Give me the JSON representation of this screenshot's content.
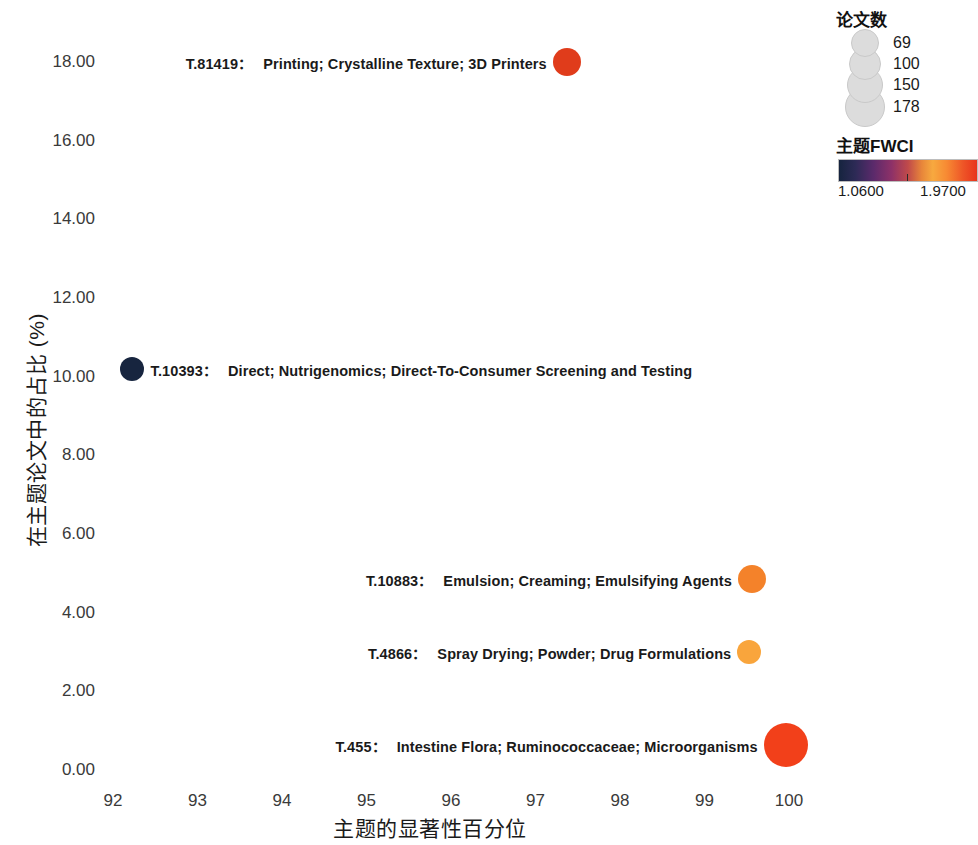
{
  "chart_data": {
    "type": "scatter",
    "title": "",
    "xlabel": "主题的显著性百分位",
    "ylabel": "在主题论文中的占比 (%)",
    "xlim": [
      91.6,
      100.4
    ],
    "ylim": [
      -0.45,
      18.6
    ],
    "xticks": [
      92,
      93,
      94,
      95,
      96,
      97,
      98,
      99,
      100
    ],
    "yticks": [
      "0.00",
      "2.00",
      "4.00",
      "6.00",
      "8.00",
      "10.00",
      "12.00",
      "14.00",
      "16.00",
      "18.00"
    ],
    "grid": false,
    "legend_position": "top-right",
    "points": [
      {
        "id": "T.81419",
        "terms": "Printing; Crystalline Texture; 3D Printers",
        "x": 97.37,
        "y": 18.0,
        "papers": 100,
        "fwci": 1.93,
        "color": "#e03c1b",
        "radius": 14,
        "label_side": "left"
      },
      {
        "id": "T.10393",
        "terms": "Direct; Nutrigenomics; Direct-To-Consumer Screening and Testing",
        "x": 92.22,
        "y": 10.2,
        "papers": 69,
        "fwci": 1.06,
        "color": "#17253f",
        "radius": 12,
        "label_side": "right"
      },
      {
        "id": "T.10883",
        "terms": "Emulsion; Creaming; Emulsifying Agents",
        "x": 99.56,
        "y": 4.85,
        "papers": 100,
        "fwci": 1.74,
        "color": "#f4822a",
        "radius": 14,
        "label_side": "left"
      },
      {
        "id": "T.4866",
        "terms": "Spray Drying; Powder; Drug Formulations",
        "x": 99.53,
        "y": 3.0,
        "papers": 69,
        "fwci": 1.67,
        "color": "#f9a53c",
        "radius": 12,
        "label_side": "left"
      },
      {
        "id": "T.455",
        "terms": "Intestine Flora; Ruminococcaceae; Microorganisms",
        "x": 99.96,
        "y": 0.63,
        "papers": 178,
        "fwci": 1.97,
        "color": "#f2401a",
        "radius": 22,
        "label_side": "left"
      }
    ],
    "size_legend": {
      "title": "论文数",
      "entries": [
        {
          "label": "69",
          "radius": 13
        },
        {
          "label": "100",
          "radius": 15
        },
        {
          "label": "150",
          "radius": 17
        },
        {
          "label": "178",
          "radius": 19
        }
      ]
    },
    "color_legend": {
      "title": "主题FWCI",
      "min_label": "1.0600",
      "max_label": "1.9700",
      "min_value": 1.06,
      "max_value": 1.97,
      "colormap": "inferno",
      "gradient_stops": [
        {
          "offset": 0,
          "color": "#16243f"
        },
        {
          "offset": 0.12,
          "color": "#2d2a56"
        },
        {
          "offset": 0.25,
          "color": "#5b2a6b"
        },
        {
          "offset": 0.38,
          "color": "#8d3168"
        },
        {
          "offset": 0.5,
          "color": "#c04a4a"
        },
        {
          "offset": 0.6,
          "color": "#e8863a"
        },
        {
          "offset": 0.68,
          "color": "#f7a93f"
        },
        {
          "offset": 0.78,
          "color": "#f78a33"
        },
        {
          "offset": 0.9,
          "color": "#ee5527"
        },
        {
          "offset": 1,
          "color": "#e8331c"
        }
      ]
    }
  },
  "label_separator": "："
}
